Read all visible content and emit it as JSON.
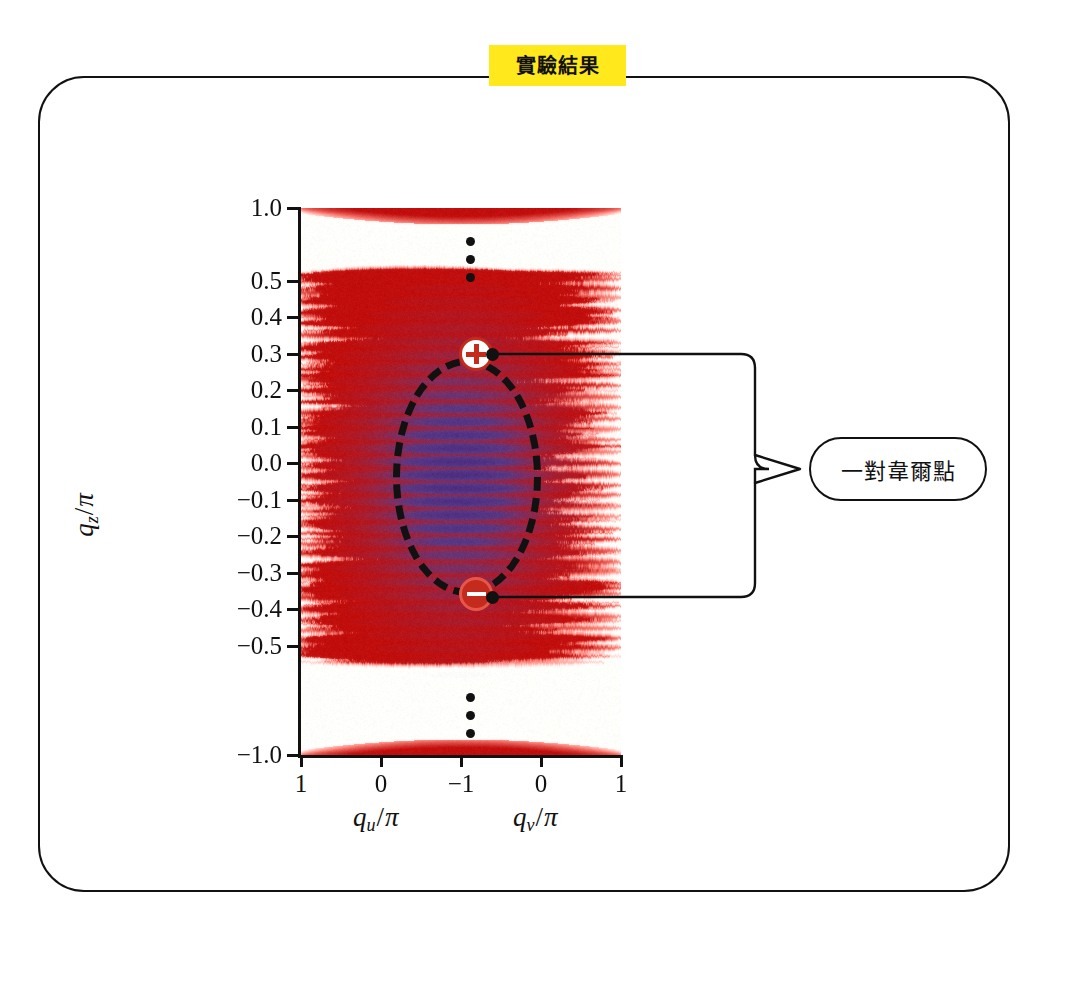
{
  "figure": {
    "title_badge": "實驗結果",
    "frame_shape": "rounded-rectangle",
    "background": "#ffffff"
  },
  "annotation": {
    "label": "一對韋爾點",
    "points_to": [
      "weyl-point-plus",
      "weyl-point-minus"
    ]
  },
  "markers": {
    "plus": {
      "symbol": "+",
      "charge": "+1",
      "qz_over_pi": 0.31,
      "color": "#C42B1C"
    },
    "minus": {
      "symbol": "−",
      "charge": "-1",
      "qz_over_pi": -0.29,
      "color": "#C42B1C"
    }
  },
  "colors": {
    "badge_yellow": "#FFE81C",
    "marker_red": "#C42B1C",
    "spectral_high": "#CC1F10",
    "spectral_core": "#5B4E9E",
    "ink": "#111111"
  },
  "chart_data": {
    "type": "heatmap",
    "title": "實驗結果",
    "subtitle": "",
    "ylabel": "q_z/π",
    "ylabel_parts": {
      "var": "q",
      "sub": "z",
      "denom": "π"
    },
    "xlabel_left": "q_u/π",
    "xlabel_left_parts": {
      "var": "q",
      "sub": "u",
      "denom": "π"
    },
    "xlabel_right": "q_v/π",
    "xlabel_right_parts": {
      "var": "q",
      "sub": "v",
      "denom": "π"
    },
    "ytick_labels": [
      "1.0",
      "0.5",
      "0.4",
      "0.3",
      "0.2",
      "0.1",
      "0.0",
      "−0.1",
      "−0.2",
      "−0.3",
      "−0.4",
      "−0.5",
      "−1.0"
    ],
    "ytick_values": [
      1.0,
      0.5,
      0.4,
      0.3,
      0.2,
      0.1,
      0.0,
      -0.1,
      -0.2,
      -0.3,
      -0.4,
      -0.5,
      -1.0
    ],
    "ytick_positions_px": [
      208,
      281,
      317,
      354,
      390,
      427,
      463,
      500,
      536,
      573,
      609,
      646,
      755
    ],
    "axis_break": true,
    "axis_break_note": "vertical ellipsis between 0.5 and 1.0 and between −0.5 and −1.0",
    "xtick_labels": [
      "1",
      "0",
      "−1",
      "0",
      "1"
    ],
    "xtick_positions_px": [
      301,
      381,
      461,
      541,
      621
    ],
    "xlim_left": [
      1,
      -1
    ],
    "xlim_right": [
      -1,
      1
    ],
    "ylim": [
      -1.0,
      1.0
    ],
    "grid": false,
    "legend": "none",
    "colormap": "white-to-red with blue/purple core",
    "annotations": [
      {
        "text": "一對韋爾點",
        "kind": "callout-box"
      },
      {
        "text": "+",
        "kind": "weyl-point",
        "x_over_pi": -0.5,
        "y_over_pi": 0.31
      },
      {
        "text": "−",
        "kind": "weyl-point",
        "x_over_pi": -0.5,
        "y_over_pi": -0.29
      },
      {
        "text": "dashed-ellipse",
        "kind": "region-highlight"
      }
    ],
    "series": [
      {
        "name": "spectral-weight",
        "description": "horizontal streaky bands of high intensity (red) across q_u/q_v at discrete q_z values, with low-energy blue/purple core between q_z/π ≈ −0.3 and 0.3"
      }
    ],
    "bands_qz": [
      1.0,
      0.53,
      0.5,
      0.47,
      0.44,
      0.41,
      0.38,
      0.35,
      0.32,
      0.29,
      0.26,
      0.23,
      0.2,
      0.17,
      0.14,
      0.11,
      0.08,
      0.05,
      0.02,
      -0.01,
      -0.04,
      -0.07,
      -0.1,
      -0.13,
      -0.16,
      -0.19,
      -0.22,
      -0.25,
      -0.28,
      -0.31,
      -0.34,
      -0.37,
      -0.4,
      -0.43,
      -0.46,
      -0.49,
      -0.52,
      -1.0
    ]
  }
}
